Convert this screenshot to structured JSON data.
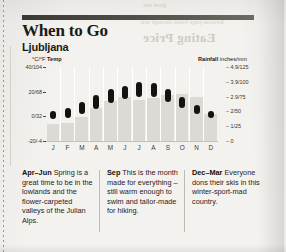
{
  "page": {
    "rule_label": "section-rule",
    "title": "When to Go",
    "subtitle": "Ljubljana"
  },
  "ghost": {
    "title": "Eating Price",
    "line": "Reverse page bleed-through text",
    "top": "ghost text"
  },
  "chart_data": {
    "type": "bar",
    "categories": [
      "J",
      "F",
      "M",
      "A",
      "M",
      "J",
      "J",
      "A",
      "S",
      "O",
      "N",
      "D"
    ],
    "temp_axis_label": "°C/°F Temp",
    "rain_axis_label": "Rainfall inches/mm",
    "temp_unit": "°C/°F",
    "rain_unit": "inches/mm",
    "temp_ticks": [
      "40/104",
      "20/68",
      "0/32",
      "-20/-4"
    ],
    "temp_tick_values": [
      40,
      20,
      0,
      -20
    ],
    "rain_ticks": [
      "4.9/125",
      "3.9/100",
      "2.9/75",
      "2/50",
      "1/25",
      "0"
    ],
    "rain_tick_values": [
      125,
      100,
      75,
      50,
      25,
      0
    ],
    "ylim_temp": [
      -20,
      40
    ],
    "ylim_rain": [
      0,
      125
    ],
    "grid": false,
    "legend": "none",
    "series": [
      {
        "name": "Temperature range (°C)",
        "type": "range-bar",
        "color": "#15130f",
        "min": [
          -2,
          -1,
          2,
          6,
          11,
          14,
          16,
          16,
          12,
          7,
          2,
          -1
        ],
        "max": [
          4,
          7,
          12,
          17,
          22,
          25,
          28,
          27,
          22,
          16,
          9,
          4
        ]
      },
      {
        "name": "Rainfall (mm)",
        "type": "bar",
        "color": "#dcdad4",
        "values": [
          28,
          30,
          40,
          55,
          68,
          75,
          70,
          72,
          78,
          80,
          75,
          45
        ]
      }
    ]
  },
  "blocks": [
    {
      "lead": "Apr–Jun",
      "text": " Spring is a great time to be in the lowlands and the flower-carpeted valleys of the Julian Alps."
    },
    {
      "lead": "Sep",
      "text": " This is the month made for everything – still warm enough to swim and tailor-made for hiking."
    },
    {
      "lead": "Dec–Mar",
      "text": " Everyone dons their skis in this winter-sport-mad country."
    }
  ]
}
